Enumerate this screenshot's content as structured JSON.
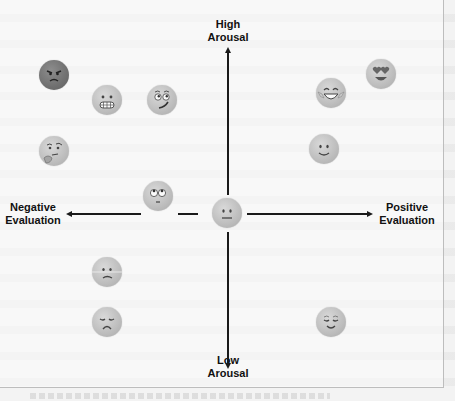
{
  "diagram": {
    "axes": {
      "top_label": [
        "High",
        "Arousal"
      ],
      "bottom_label": [
        "Low",
        "Arousal"
      ],
      "left_label": [
        "Negative",
        "Evaluation"
      ],
      "right_label": [
        "Positive",
        "Evaluation"
      ]
    },
    "emojis": [
      {
        "name": "angry-face",
        "quadrant": "negative-high",
        "x": 54,
        "y": 75
      },
      {
        "name": "grimacing-face",
        "quadrant": "negative-high",
        "x": 107,
        "y": 100
      },
      {
        "name": "woozy-face",
        "quadrant": "negative-high",
        "x": 162,
        "y": 100
      },
      {
        "name": "thinking-face",
        "quadrant": "negative-high",
        "x": 54,
        "y": 151
      },
      {
        "name": "face-with-rolling-eyes",
        "quadrant": "negative-center",
        "x": 158,
        "y": 196
      },
      {
        "name": "neutral-face",
        "quadrant": "center",
        "x": 227,
        "y": 213
      },
      {
        "name": "face-with-tears-of-joy",
        "quadrant": "positive-high",
        "x": 331,
        "y": 93
      },
      {
        "name": "smiling-face-with-heart-eyes",
        "quadrant": "positive-high",
        "x": 381,
        "y": 74
      },
      {
        "name": "slightly-smiling-face",
        "quadrant": "positive-high",
        "x": 324,
        "y": 149
      },
      {
        "name": "confused-face",
        "quadrant": "negative-low",
        "x": 107,
        "y": 272
      },
      {
        "name": "disappointed-face",
        "quadrant": "negative-low",
        "x": 107,
        "y": 322
      },
      {
        "name": "relieved-face",
        "quadrant": "positive-low",
        "x": 331,
        "y": 322
      }
    ]
  }
}
